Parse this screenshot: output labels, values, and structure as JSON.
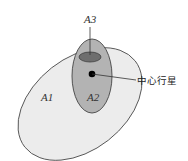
{
  "diagram": {
    "regions": [
      {
        "id": "A1",
        "label": "A1",
        "fill": "#ececec",
        "stroke": "#555555"
      },
      {
        "id": "A2",
        "label": "A2",
        "fill": "#b3b3b3",
        "stroke": "#444444"
      },
      {
        "id": "A3",
        "label": "A3",
        "fill": "#6e6e6e",
        "stroke": "#333333"
      }
    ],
    "center_planet": {
      "label": "中心行星",
      "fill": "#000000"
    }
  }
}
